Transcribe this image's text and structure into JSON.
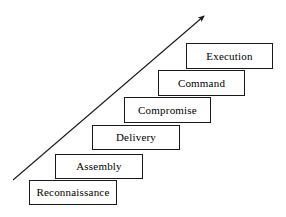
{
  "diagram": {
    "type": "staircase-process-diagram",
    "background_color": "#ffffff",
    "box_border_color": "#1a1a1a",
    "box_fill_color": "#ffffff",
    "text_color": "#000000",
    "arrow": {
      "name": "progression-arrow",
      "color": "#1a1a1a",
      "direction": "up-right",
      "start": {
        "x": 13,
        "y": 180
      },
      "end": {
        "x": 208,
        "y": 12
      }
    },
    "steps": [
      {
        "order": 1,
        "label": "Reconnaissance",
        "x": 29,
        "y": 180,
        "width": 88,
        "height": 25
      },
      {
        "order": 2,
        "label": "Assembly",
        "x": 55,
        "y": 154,
        "width": 88,
        "height": 25
      },
      {
        "order": 3,
        "label": "Delivery",
        "x": 92,
        "y": 125,
        "width": 88,
        "height": 25
      },
      {
        "order": 4,
        "label": "Compromise",
        "x": 124,
        "y": 97,
        "width": 87,
        "height": 26
      },
      {
        "order": 5,
        "label": "Command",
        "x": 158,
        "y": 70,
        "width": 87,
        "height": 26
      },
      {
        "order": 6,
        "label": "Execution",
        "x": 186,
        "y": 43,
        "width": 87,
        "height": 26
      }
    ]
  }
}
